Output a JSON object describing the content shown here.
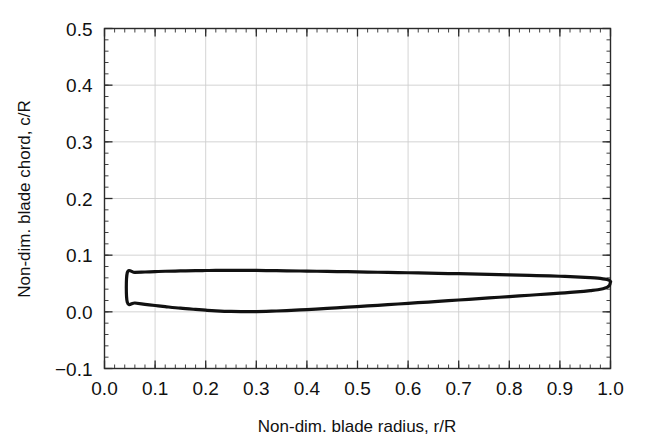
{
  "chart_data": {
    "type": "line",
    "title": "",
    "subtitle": "",
    "xlabel": "Non-dim. blade radius, r/R",
    "ylabel": "Non-dim. blade chord, c/R",
    "xlim": [
      0.0,
      1.0
    ],
    "ylim": [
      -0.1,
      0.5
    ],
    "xticks": [
      "0.0",
      "0.1",
      "0.2",
      "0.3",
      "0.4",
      "0.5",
      "0.6",
      "0.7",
      "0.8",
      "0.9",
      "1.0"
    ],
    "yticks": [
      "-0.1",
      "0.0",
      "0.1",
      "0.2",
      "0.3",
      "0.4",
      "0.5"
    ],
    "xtick_values": [
      0.0,
      0.1,
      0.2,
      0.3,
      0.4,
      0.5,
      0.6,
      0.7,
      0.8,
      0.9,
      1.0
    ],
    "ytick_values": [
      -0.1,
      0.0,
      0.1,
      0.2,
      0.3,
      0.4,
      0.5
    ],
    "minor_tick_step_x": 0.02,
    "minor_tick_step_y": 0.02,
    "grid": true,
    "grid_color": "#cfcfcf",
    "axis_color": "#2b2b2b",
    "line_color": "#111111",
    "line_width": 3.2,
    "legend": null,
    "legend_position": "none",
    "annotations": [],
    "series": [
      {
        "name": "Blade leading edge (upper boundary)",
        "x": [
          0.045,
          0.06,
          0.08,
          0.1,
          0.12,
          0.15,
          0.18,
          0.2,
          0.22,
          0.25,
          0.28,
          0.3,
          0.33,
          0.36,
          0.4,
          0.44,
          0.48,
          0.52,
          0.56,
          0.6,
          0.64,
          0.68,
          0.72,
          0.76,
          0.8,
          0.84,
          0.88,
          0.91,
          0.94,
          0.96,
          0.975,
          0.985,
          0.993,
          0.998,
          1.0
        ],
        "y": [
          0.069,
          0.0695,
          0.0703,
          0.071,
          0.0716,
          0.0722,
          0.0727,
          0.0729,
          0.0731,
          0.0732,
          0.0731,
          0.073,
          0.0727,
          0.0724,
          0.0719,
          0.0714,
          0.0708,
          0.0702,
          0.0696,
          0.069,
          0.0683,
          0.0676,
          0.0669,
          0.0661,
          0.0653,
          0.0644,
          0.0634,
          0.0625,
          0.0614,
          0.0604,
          0.0594,
          0.0583,
          0.057,
          0.0556,
          0.053
        ]
      },
      {
        "name": "Blade trailing edge (lower boundary)",
        "x": [
          0.045,
          0.06,
          0.08,
          0.1,
          0.12,
          0.15,
          0.18,
          0.2,
          0.22,
          0.25,
          0.28,
          0.3,
          0.33,
          0.36,
          0.4,
          0.44,
          0.48,
          0.52,
          0.56,
          0.6,
          0.64,
          0.68,
          0.72,
          0.76,
          0.8,
          0.84,
          0.88,
          0.91,
          0.94,
          0.96,
          0.975,
          0.985,
          0.993,
          0.998,
          1.0
        ],
        "y": [
          0.017,
          0.0156,
          0.0133,
          0.0112,
          0.0092,
          0.0064,
          0.0042,
          0.0029,
          0.0018,
          0.0007,
          0.0004,
          0.0005,
          0.0012,
          0.0022,
          0.004,
          0.006,
          0.0082,
          0.0104,
          0.0127,
          0.015,
          0.0173,
          0.0197,
          0.0221,
          0.0245,
          0.0269,
          0.0293,
          0.0318,
          0.0336,
          0.0357,
          0.0375,
          0.039,
          0.0408,
          0.0432,
          0.0465,
          0.053
        ]
      }
    ]
  }
}
